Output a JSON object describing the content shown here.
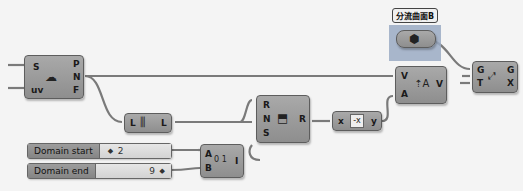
{
  "canvas": {
    "background": "#f4f4f4",
    "wire_color": "#7a7a7a"
  },
  "nodes": {
    "evaluate_surface": {
      "inputs": [
        "S",
        "uv"
      ],
      "outputs": [
        "P",
        "N",
        "F"
      ],
      "icon": "surface-point-icon"
    },
    "list_length": {
      "input": "L",
      "output": "L",
      "icon": "list-length-icon"
    },
    "rotate_vector": {
      "inputs": [
        "R",
        "N",
        "S"
      ],
      "output": "R",
      "icon": "rotate-icon"
    },
    "expression": {
      "input": "x",
      "output": "y",
      "icon": "expression-icon",
      "glyph": "-x"
    },
    "vector_amplitude": {
      "inputs": [
        "V",
        "A"
      ],
      "output": "V",
      "icon": "amplitude-icon"
    },
    "move": {
      "inputs": [
        "G",
        "T"
      ],
      "outputs": [
        "G",
        "X"
      ],
      "icon": "move-icon"
    },
    "range": {
      "inputs": [
        "A",
        "B"
      ],
      "output": "I",
      "icon": "range-icon",
      "glyph": "0 1"
    },
    "surface_param": {
      "tag": "分流曲面B",
      "icon": "surface-param-icon"
    }
  },
  "sliders": [
    {
      "label": "Domain start",
      "value": "2",
      "marker": "◆"
    },
    {
      "label": "Domain end",
      "value": "9",
      "marker": "◆"
    }
  ]
}
